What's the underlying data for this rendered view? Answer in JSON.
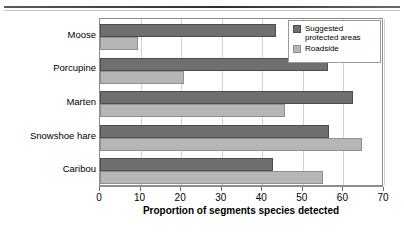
{
  "chart_data": {
    "type": "bar",
    "orientation": "horizontal",
    "title": "",
    "xlabel": "Proportion of segments species detected",
    "ylabel": "",
    "xlim": [
      0,
      70
    ],
    "xticks": [
      0,
      10,
      20,
      30,
      40,
      50,
      60,
      70
    ],
    "grid": true,
    "legend_position": "top-right",
    "categories": [
      "Moose",
      "Porcupine",
      "Marten",
      "Snowshoe hare",
      "Caribou"
    ],
    "series": [
      {
        "name": "Suggested protected areas",
        "color": "#6f6f6f",
        "values": [
          43.5,
          56.2,
          62.4,
          56.4,
          42.6
        ]
      },
      {
        "name": "Roadside",
        "color": "#b6b6b6",
        "values": [
          9.4,
          20.7,
          45.6,
          64.6,
          55.0
        ]
      }
    ]
  },
  "legend": {
    "entries": [
      {
        "label": "Suggested protected areas",
        "swatch": "dark-gray-swatch"
      },
      {
        "label": "Roadside",
        "swatch": "light-gray-swatch"
      }
    ]
  },
  "axis": {
    "x_title": "Proportion of segments species detected",
    "tick_labels": [
      "0",
      "10",
      "20",
      "30",
      "40",
      "50",
      "60",
      "70"
    ]
  },
  "category_labels": [
    "Moose",
    "Porcupine",
    "Marten",
    "Snowshoe hare",
    "Caribou"
  ]
}
